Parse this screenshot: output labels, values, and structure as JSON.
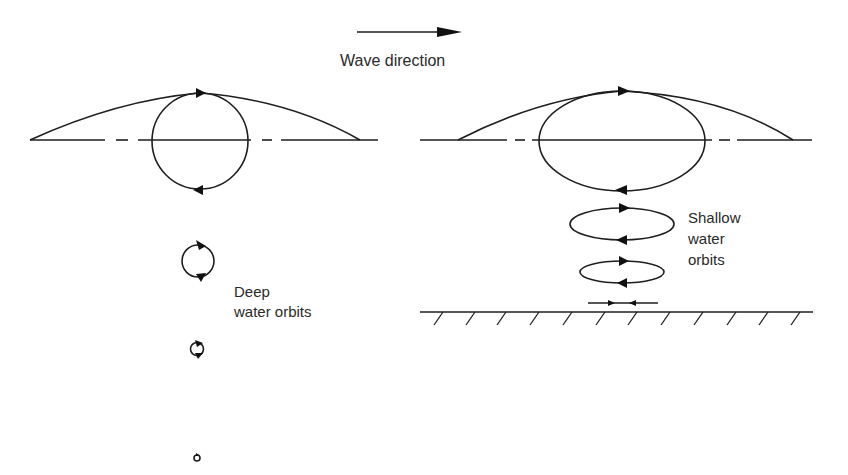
{
  "labels": {
    "wave_direction": "Wave direction",
    "deep_line1": "Deep",
    "deep_line2": "water orbits",
    "shallow_line1": "Shallow",
    "shallow_line2": "water",
    "shallow_line3": "orbits"
  },
  "panels": {
    "deep": {
      "name": "Deep water orbits",
      "orbit_shape": "circle",
      "orbits_count": 4,
      "orbit_radii_px": [
        48,
        17,
        7,
        3
      ]
    },
    "shallow": {
      "name": "Shallow water orbits",
      "orbit_shape": "ellipse",
      "orbits_count": 3,
      "has_seabed": true,
      "seabed_motion": "back-and-forth horizontal oscillation"
    }
  },
  "colors": {
    "ink": "#1e1e1e",
    "background": "#ffffff"
  }
}
